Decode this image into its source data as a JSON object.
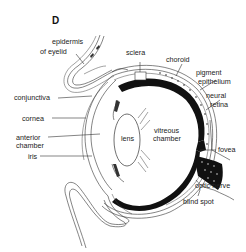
{
  "figure": {
    "panel_letter": "D",
    "labels": {
      "epidermis_line1": "epidermis",
      "epidermis_line2": "of eyelid",
      "sclera": "sclera",
      "choroid": "choroid",
      "pigment_line1": "pigment",
      "pigment_line2": "epithelium",
      "neural_line1": "neural",
      "neural_line2": "retina",
      "conjunctiva": "conjunctiva",
      "cornea": "cornea",
      "anterior_line1": "anterior",
      "anterior_line2": "chamber",
      "iris": "iris",
      "lens": "lens",
      "vitreous_line1": "vitreous",
      "vitreous_line2": "chamber",
      "fovea": "fovea",
      "optic_nerve": "optic nerve",
      "blind_spot": "blind spot"
    },
    "colors": {
      "ink": "#222222",
      "retina_fill": "#111111",
      "background": "#ffffff"
    }
  }
}
